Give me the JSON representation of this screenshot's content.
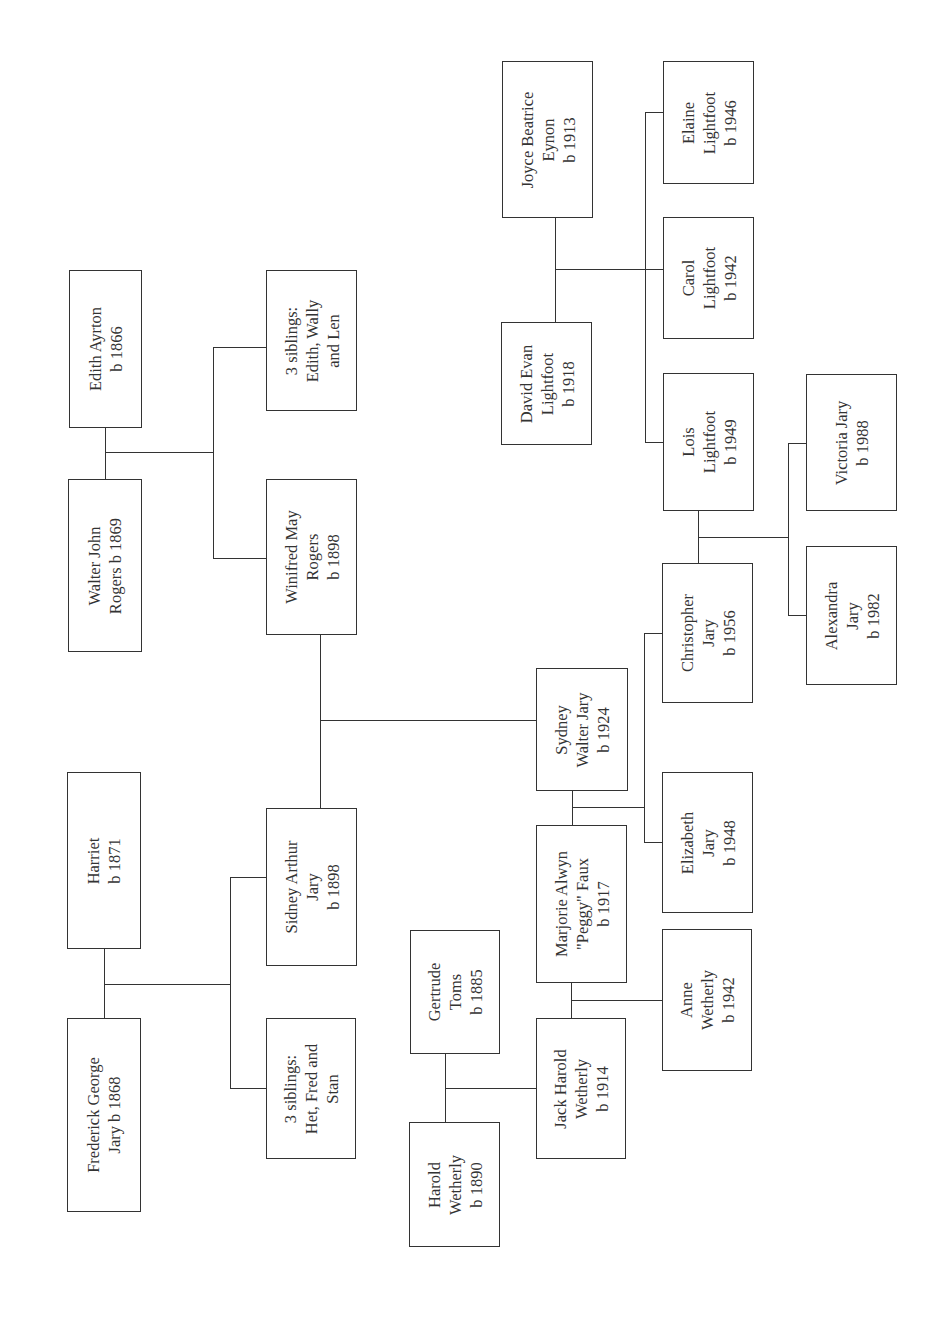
{
  "people": {
    "frederick": {
      "label": "Frederick George\nJary b 1868"
    },
    "harriet": {
      "label": "Harriet\nb 1871"
    },
    "siblings_jary": {
      "label": "3 siblings:\nHet, Fred and\nStan"
    },
    "sidney": {
      "label": "Sidney Arthur\nJary\nb 1898"
    },
    "walter": {
      "label": "Walter John\nRogers b 1869"
    },
    "edith_ayrton": {
      "label": "Edith Ayrton\nb 1866"
    },
    "siblings_rogers": {
      "label": "3 siblings:\nEdith, Wally\nand Len"
    },
    "winifred": {
      "label": "Winifred May\nRogers\nb 1898"
    },
    "harold": {
      "label": "Harold\nWetherly\nb 1890"
    },
    "gertrude": {
      "label": "Gertrude\nToms\nb 1885"
    },
    "jack": {
      "label": "Jack Harold\nWetherly\nb 1914"
    },
    "marjorie": {
      "label": "Marjorie Alwyn\n\"Peggy\" Faux\nb 1917"
    },
    "anne": {
      "label": "Anne\nWetherly\nb 1942"
    },
    "sydney": {
      "label": "Sydney\nWalter Jary\nb 1924"
    },
    "elizabeth": {
      "label": "Elizabeth\nJary\nb 1948"
    },
    "christopher": {
      "label": "Christopher\nJary\nb 1956"
    },
    "lois": {
      "label": "Lois\nLightfoot\nb 1949"
    },
    "alexandra": {
      "label": "Alexandra\nJary\nb 1982"
    },
    "victoria": {
      "label": "Victoria Jary\nb 1988"
    },
    "david": {
      "label": "David Evan\nLightfoot\nb 1918"
    },
    "joyce": {
      "label": "Joyce Beatrice\nEynon\nb 1913"
    },
    "carol": {
      "label": "Carol\nLightfoot\nb 1942"
    },
    "elaine": {
      "label": "Elaine\nLightfoot\nb 1946"
    }
  },
  "colors": {
    "line": "#333333",
    "background": "#ffffff"
  }
}
